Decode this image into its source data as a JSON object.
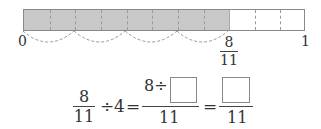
{
  "number_line": {
    "start_label": "0",
    "end_label": "1",
    "segments": 11,
    "shaded_segments": 8,
    "shade_color": "#c8c8c8",
    "marker": {
      "numerator": "8",
      "denominator": "11"
    },
    "jumps": 4
  },
  "equation": {
    "lhs": {
      "numerator": "8",
      "denominator": "11"
    },
    "divide_sign": "÷",
    "divisor": "4",
    "equals": "=",
    "middle": {
      "numerator_prefix": "8÷",
      "denominator": "11"
    },
    "rhs": {
      "denominator": "11"
    }
  }
}
